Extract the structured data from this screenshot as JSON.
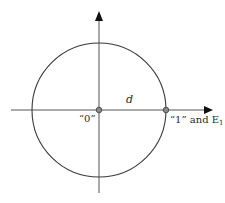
{
  "diagram": {
    "type": "circle-on-axes",
    "colors": {
      "stroke": "#3a3a3a",
      "axis": "#555555",
      "dot_fill": "#8a8a8a",
      "background": "#ffffff"
    },
    "center": {
      "x": 99,
      "y": 110
    },
    "radius": 67,
    "axes": {
      "horizontal": {
        "x1": 11,
        "x2": 212,
        "y": 110,
        "arrow": "right"
      },
      "vertical": {
        "x": 99,
        "y1": 193,
        "y2": 12,
        "arrow": "up"
      }
    },
    "points": [
      {
        "id": "origin",
        "x": 99,
        "y": 110,
        "label": "“0”"
      },
      {
        "id": "unit",
        "x": 166,
        "y": 110,
        "label": "“1” and E",
        "label_sub": "1"
      }
    ],
    "segment_label": "d"
  }
}
